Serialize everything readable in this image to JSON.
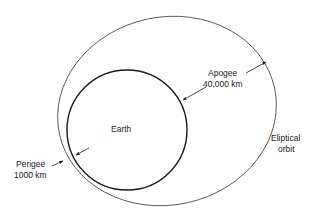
{
  "diagram": {
    "earth": {
      "label": "Earth"
    },
    "orbit": {
      "label_line1": "Eliptical",
      "label_line2": "orbit"
    },
    "apogee": {
      "label": "Apogee",
      "distance": "40,000 km"
    },
    "perigee": {
      "label": "Perigee",
      "distance": "1000 km"
    },
    "colors": {
      "earth_stroke": "#1a1a1a",
      "orbit_stroke": "#555555",
      "text": "#1a1a1a",
      "background": "#ffffff"
    }
  }
}
